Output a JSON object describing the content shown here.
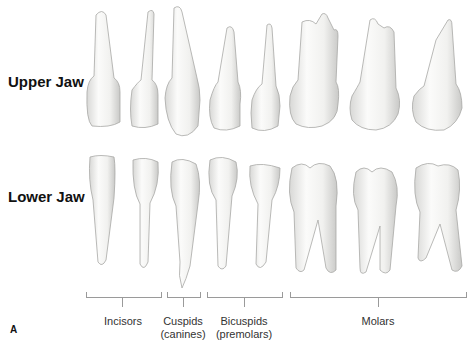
{
  "figure": {
    "letter": "A",
    "rows": [
      {
        "label": "Upper Jaw"
      },
      {
        "label": "Lower Jaw"
      }
    ],
    "groups": [
      {
        "label": "Incisors",
        "sub": ""
      },
      {
        "label": "Cuspids",
        "sub": "(canines)"
      },
      {
        "label": "Bicuspids",
        "sub": "(premolars)"
      },
      {
        "label": "Molars",
        "sub": ""
      }
    ],
    "colors": {
      "tooth_fill": "#f4f4f2",
      "tooth_shade": "#d6d6d4",
      "tooth_edge": "#a8a8a6",
      "bracket": "#9a9a9a"
    }
  }
}
